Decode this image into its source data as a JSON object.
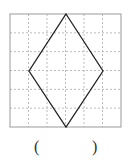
{
  "grid": {
    "cols": 6,
    "rows": 6,
    "left": 10,
    "top": 14,
    "right": 121,
    "bottom": 127,
    "line_color": "#bbbbbb",
    "border_color": "#999999"
  },
  "shape": {
    "type": "rhombus",
    "points": [
      [
        66,
        14
      ],
      [
        103,
        71
      ],
      [
        66,
        127
      ],
      [
        29,
        71
      ]
    ],
    "stroke": "#222222"
  },
  "answer": {
    "open": "(",
    "close": ")",
    "value": ""
  }
}
